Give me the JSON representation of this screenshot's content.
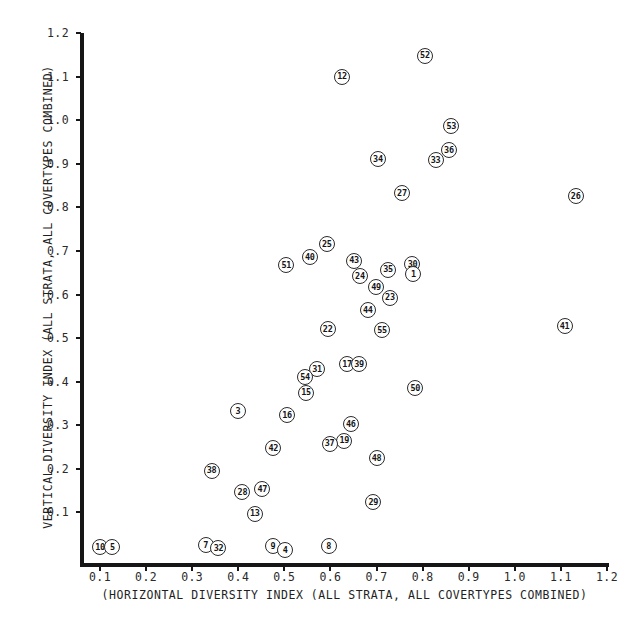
{
  "chart_data": {
    "type": "scatter",
    "title": "",
    "xlabel": "(HORIZONTAL DIVERSITY INDEX (ALL STRATA, ALL COVERTYPES COMBINED)",
    "ylabel": "VERTICAL DIVERSITY INDEX (ALL STRATA, ALL COVERTYPES COMBINED)",
    "xlim": [
      0.045,
      1.2
    ],
    "ylim": [
      0.0,
      1.2
    ],
    "grid": false,
    "legend": null,
    "xticks": [
      "0.1",
      "0.2",
      "0.3",
      "0.4",
      "0.5",
      "0.6",
      "0.7",
      "0.8",
      "0.9",
      "1.0",
      "1.1",
      "1.2"
    ],
    "xtick_values": [
      0.1,
      0.2,
      0.3,
      0.4,
      0.5,
      0.6,
      0.7,
      0.8,
      0.9,
      1.0,
      1.1,
      1.2
    ],
    "yticks": [
      "0.1",
      "0.2",
      "0.3",
      "0.4",
      "0.5",
      "0.6",
      "0.7",
      "0.8",
      "0.9",
      "1.0",
      "1.1",
      "1.2"
    ],
    "ytick_values": [
      0.1,
      0.2,
      0.3,
      0.4,
      0.5,
      0.6,
      0.7,
      0.8,
      0.9,
      1.0,
      1.1,
      1.2
    ],
    "marker": "numbered-circle",
    "point_color": "#ffffff",
    "stroke_color": "#2b2b2b",
    "points": [
      {
        "label": "52",
        "x": 0.805,
        "y": 1.148
      },
      {
        "label": "12",
        "x": 0.625,
        "y": 1.1
      },
      {
        "label": "53",
        "x": 0.862,
        "y": 0.987
      },
      {
        "label": "36",
        "x": 0.857,
        "y": 0.932
      },
      {
        "label": "34",
        "x": 0.703,
        "y": 0.911
      },
      {
        "label": "33",
        "x": 0.828,
        "y": 0.909
      },
      {
        "label": "26",
        "x": 1.132,
        "y": 0.826
      },
      {
        "label": "27",
        "x": 0.755,
        "y": 0.833
      },
      {
        "label": "25",
        "x": 0.592,
        "y": 0.716
      },
      {
        "label": "40",
        "x": 0.555,
        "y": 0.686
      },
      {
        "label": "43",
        "x": 0.651,
        "y": 0.678
      },
      {
        "label": "51",
        "x": 0.504,
        "y": 0.668
      },
      {
        "label": "30",
        "x": 0.778,
        "y": 0.67
      },
      {
        "label": "35",
        "x": 0.725,
        "y": 0.657
      },
      {
        "label": "1",
        "x": 0.78,
        "y": 0.646
      },
      {
        "label": "24",
        "x": 0.664,
        "y": 0.643
      },
      {
        "label": "49",
        "x": 0.699,
        "y": 0.617
      },
      {
        "label": "23",
        "x": 0.729,
        "y": 0.593
      },
      {
        "label": "44",
        "x": 0.681,
        "y": 0.565
      },
      {
        "label": "41",
        "x": 1.108,
        "y": 0.528
      },
      {
        "label": "55",
        "x": 0.712,
        "y": 0.518
      },
      {
        "label": "22",
        "x": 0.594,
        "y": 0.52
      },
      {
        "label": "17",
        "x": 0.636,
        "y": 0.44
      },
      {
        "label": "39",
        "x": 0.662,
        "y": 0.44
      },
      {
        "label": "31",
        "x": 0.571,
        "y": 0.428
      },
      {
        "label": "54",
        "x": 0.545,
        "y": 0.411
      },
      {
        "label": "50",
        "x": 0.784,
        "y": 0.386
      },
      {
        "label": "15",
        "x": 0.547,
        "y": 0.375
      },
      {
        "label": "3",
        "x": 0.399,
        "y": 0.333
      },
      {
        "label": "16",
        "x": 0.506,
        "y": 0.323
      },
      {
        "label": "46",
        "x": 0.644,
        "y": 0.302
      },
      {
        "label": "19",
        "x": 0.63,
        "y": 0.265
      },
      {
        "label": "37",
        "x": 0.598,
        "y": 0.258
      },
      {
        "label": "42",
        "x": 0.476,
        "y": 0.247
      },
      {
        "label": "48",
        "x": 0.7,
        "y": 0.225
      },
      {
        "label": "38",
        "x": 0.342,
        "y": 0.196
      },
      {
        "label": "47",
        "x": 0.452,
        "y": 0.153
      },
      {
        "label": "28",
        "x": 0.409,
        "y": 0.147
      },
      {
        "label": "29",
        "x": 0.693,
        "y": 0.124
      },
      {
        "label": "13",
        "x": 0.436,
        "y": 0.097
      },
      {
        "label": "10",
        "x": 0.1,
        "y": 0.021
      },
      {
        "label": "5",
        "x": 0.127,
        "y": 0.021
      },
      {
        "label": "7",
        "x": 0.329,
        "y": 0.025
      },
      {
        "label": "32",
        "x": 0.357,
        "y": 0.018
      },
      {
        "label": "9",
        "x": 0.475,
        "y": 0.022
      },
      {
        "label": "4",
        "x": 0.502,
        "y": 0.014
      },
      {
        "label": "8",
        "x": 0.596,
        "y": 0.022
      }
    ]
  }
}
